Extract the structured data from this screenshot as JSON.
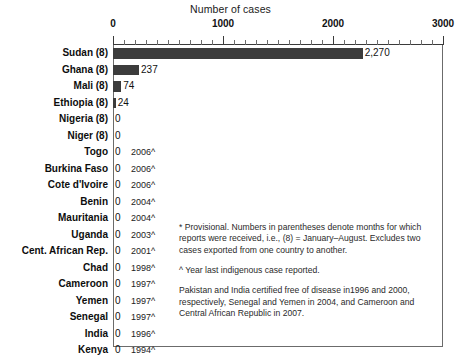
{
  "chart_data": {
    "type": "bar",
    "orientation": "horizontal",
    "title": "Number of cases",
    "xlabel": "Number of cases",
    "ylabel": "",
    "xlim": [
      0,
      3000
    ],
    "xticks": [
      0,
      1000,
      2000,
      3000
    ],
    "xtick_labels": [
      "0",
      "1000",
      "2000",
      "3000"
    ],
    "minor_tick_interval": 100,
    "grid": false,
    "legend": null,
    "bar_color": "#3c3c3c",
    "categories": [
      "Sudan (8)",
      "Ghana (8)",
      "Mali (8)",
      "Ethiopia (8)",
      "Nigeria (8)",
      "Niger (8)",
      "Togo",
      "Burkina Faso",
      "Cote d'Ivoire",
      "Benin",
      "Mauritania",
      "Uganda",
      "Cent. African Rep.",
      "Chad",
      "Cameroon",
      "Yemen",
      "Senegal",
      "India",
      "Kenya",
      "Pakistan"
    ],
    "values": [
      2270,
      237,
      74,
      24,
      0,
      0,
      0,
      0,
      0,
      0,
      0,
      0,
      0,
      0,
      0,
      0,
      0,
      0,
      0,
      0
    ],
    "value_labels": [
      "2,270",
      "237",
      "74",
      "24",
      "0",
      "0",
      "0",
      "0",
      "0",
      "0",
      "0",
      "0",
      "0",
      "0",
      "0",
      "0",
      "0",
      "0",
      "0",
      "0"
    ],
    "annotations": [
      "",
      "",
      "",
      "",
      "",
      "",
      "2006^",
      "2006^",
      "2006^",
      "2004^",
      "2004^",
      "2003^",
      "2001^",
      "1998^",
      "1997^",
      "1997^",
      "1997^",
      "1996^",
      "1994^",
      "1993^"
    ]
  },
  "rows": [
    {
      "label": "Sudan (8)",
      "value": 2270,
      "value_label": "2,270",
      "year": ""
    },
    {
      "label": "Ghana (8)",
      "value": 237,
      "value_label": "237",
      "year": ""
    },
    {
      "label": "Mali (8)",
      "value": 74,
      "value_label": "74",
      "year": ""
    },
    {
      "label": "Ethiopia (8)",
      "value": 24,
      "value_label": "24",
      "year": ""
    },
    {
      "label": "Nigeria (8)",
      "value": 0,
      "value_label": "0",
      "year": ""
    },
    {
      "label": "Niger (8)",
      "value": 0,
      "value_label": "0",
      "year": ""
    },
    {
      "label": "Togo",
      "value": 0,
      "value_label": "0",
      "year": "2006^"
    },
    {
      "label": "Burkina Faso",
      "value": 0,
      "value_label": "0",
      "year": "2006^"
    },
    {
      "label": "Cote d'Ivoire",
      "value": 0,
      "value_label": "0",
      "year": "2006^"
    },
    {
      "label": "Benin",
      "value": 0,
      "value_label": "0",
      "year": "2004^"
    },
    {
      "label": "Mauritania",
      "value": 0,
      "value_label": "0",
      "year": "2004^"
    },
    {
      "label": "Uganda",
      "value": 0,
      "value_label": "0",
      "year": "2003^"
    },
    {
      "label": "Cent. African Rep.",
      "value": 0,
      "value_label": "0",
      "year": "2001^"
    },
    {
      "label": "Chad",
      "value": 0,
      "value_label": "0",
      "year": "1998^"
    },
    {
      "label": "Cameroon",
      "value": 0,
      "value_label": "0",
      "year": "1997^"
    },
    {
      "label": "Yemen",
      "value": 0,
      "value_label": "0",
      "year": "1997^"
    },
    {
      "label": "Senegal",
      "value": 0,
      "value_label": "0",
      "year": "1997^"
    },
    {
      "label": "India",
      "value": 0,
      "value_label": "0",
      "year": "1996^"
    },
    {
      "label": "Kenya",
      "value": 0,
      "value_label": "0",
      "year": "1994^"
    },
    {
      "label": "Pakistan",
      "value": 0,
      "value_label": "0",
      "year": "1993^"
    }
  ],
  "footnotes": {
    "provisional": "* Provisional. Numbers in parentheses denote months for which reports were received, i.e., (8) = January–August. Excludes two cases exported from one country to another.",
    "year_note": "^ Year last indigenous case reported.",
    "certification": "Pakistan and India certified free of disease in1996 and 2000, respectively,  Senegal and Yemen in 2004, and Cameroon and Central African Republic in 2007."
  }
}
